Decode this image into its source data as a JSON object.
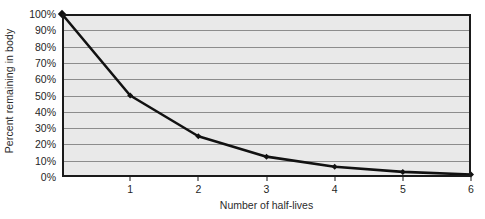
{
  "chart_data": {
    "type": "line",
    "title": "",
    "xlabel": "Number of half-lives",
    "ylabel": "Percent remaining in body",
    "x": [
      0,
      1,
      2,
      3,
      4,
      5,
      6
    ],
    "values": [
      100,
      50,
      25,
      12.5,
      6.25,
      3.125,
      1.5625
    ],
    "series": [
      {
        "name": "Percent remaining in body",
        "values": [
          100,
          50,
          25,
          12.5,
          6.25,
          3.125,
          1.5625
        ]
      }
    ],
    "x_tick_labels": [
      "1",
      "2",
      "3",
      "4",
      "5",
      "6"
    ],
    "x_tick_values": [
      1,
      2,
      3,
      4,
      5,
      6
    ],
    "y_tick_labels": [
      "100%",
      "90%",
      "80%",
      "70%",
      "60%",
      "50%",
      "40%",
      "30%",
      "20%",
      "10%",
      "0%"
    ],
    "y_tick_values": [
      100,
      90,
      80,
      70,
      60,
      50,
      40,
      30,
      20,
      10,
      0
    ],
    "xlim": [
      0,
      6
    ],
    "ylim": [
      0,
      100
    ],
    "grid": "horizontal",
    "legend": "none",
    "marker": "diamond",
    "colors": {
      "line": "#111111",
      "marker": "#111111",
      "plot_background": "#e9e9e9",
      "gridline": "#8c8c8c",
      "axis": "#1a1a1a",
      "text": "#1f1f1f"
    }
  }
}
